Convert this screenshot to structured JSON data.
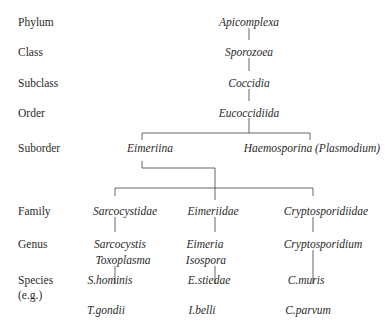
{
  "ranks": [
    {
      "label": "Phylum",
      "y": 16
    },
    {
      "label": "Class",
      "y": 46
    },
    {
      "label": "Subclass",
      "y": 77
    },
    {
      "label": "Order",
      "y": 107
    },
    {
      "label": "Suborder",
      "y": 142
    },
    {
      "label": "Family",
      "y": 205
    },
    {
      "label": "Genus",
      "y": 238
    },
    {
      "label": "Species",
      "y": 274
    },
    {
      "label": "(e.g.)",
      "y": 289
    }
  ],
  "taxa": {
    "phylum": "Apicomplexa",
    "class": "Sporozoea",
    "subclass": "Coccidia",
    "order": "Eucoccidiida",
    "suborders": [
      "Eimeriina",
      "Haemosporina (Plasmodium)"
    ],
    "families": [
      "Sarcocystidae",
      "Eimeriidae",
      "Cryptosporidiidae"
    ],
    "genera": {
      "sarcocystidae": [
        "Sarcocystis",
        "Toxoplasma"
      ],
      "eimeriidae": [
        "Eimeria",
        "Isospora"
      ],
      "cryptosporidiidae": [
        "Cryptosporidium"
      ]
    },
    "species": {
      "sarcocystidae": [
        "S.hominis",
        "T.gondii"
      ],
      "eimeriidae": [
        "E.stiedae",
        "I.belli"
      ],
      "cryptosporidiidae": [
        "C.muris",
        "C.parvum"
      ]
    }
  },
  "line_color": "#555555"
}
